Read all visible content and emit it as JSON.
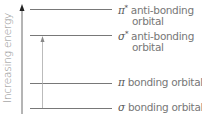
{
  "axis": {
    "label": "Increasing energy",
    "direction": "up"
  },
  "levels": [
    {
      "id": "pi-star",
      "symbol": "π",
      "sup": "*",
      "line1": " anti-bonding",
      "line2": "orbital",
      "y": 9
    },
    {
      "id": "sigma-star",
      "symbol": "σ",
      "sup": "*",
      "line1": " anti-bonding",
      "line2": "orbital",
      "y": 35
    },
    {
      "id": "pi",
      "symbol": "π",
      "sup": "",
      "line1": " bonding orbital",
      "line2": "",
      "y": 83
    },
    {
      "id": "sigma",
      "symbol": "σ",
      "sup": "",
      "line1": " bonding orbital",
      "line2": "",
      "y": 108
    }
  ],
  "transition": {
    "from": "sigma",
    "to": "sigma-star"
  },
  "colors": {
    "line": "#555555",
    "transition": "#aaaaaa",
    "text": "#777777"
  }
}
